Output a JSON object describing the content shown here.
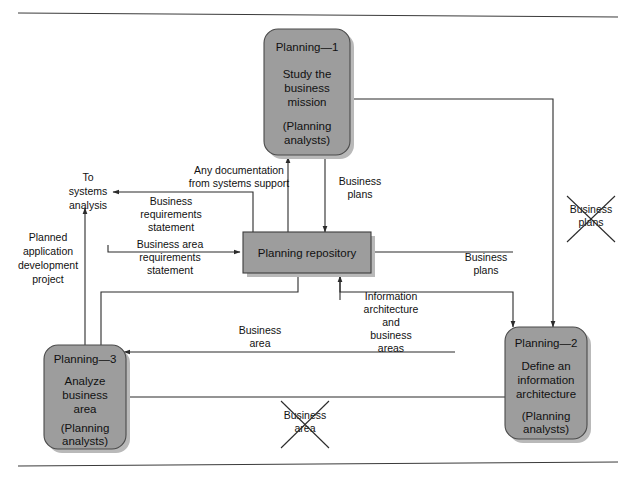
{
  "figure": {
    "background_color": "#ffffff",
    "box_fill_color": "#9d9d9d",
    "line_color": "#2b2b2b"
  },
  "processes": [
    {
      "id": "planning-1",
      "number": "Planning—1",
      "name_line1": "Study the",
      "name_line2": "business",
      "name_line3": "mission",
      "actor_line1": "(Planning",
      "actor_line2": "analysts)"
    },
    {
      "id": "planning-2",
      "number": "Planning—2",
      "name_line1": "Define an",
      "name_line2": "information",
      "name_line3": "architecture",
      "actor_line1": "(Planning",
      "actor_line2": "analysts)"
    },
    {
      "id": "planning-3",
      "number": "Planning—3",
      "name_line1": "Analyze",
      "name_line2": "business",
      "name_line3": "area",
      "actor_line1": "(Planning",
      "actor_line2": "analysts)"
    }
  ],
  "datastore": {
    "id": "planning-repository",
    "label": "Planning repository"
  },
  "external": {
    "to_systems_analysis": {
      "line1": "To",
      "line2": "systems",
      "line3": "analysis"
    },
    "planned_application": {
      "line1": "Planned",
      "line2": "application",
      "line3": "development",
      "line4": "project"
    }
  },
  "flows": [
    {
      "id": "any-documentation",
      "line1": "Any documentation",
      "line2": "from systems support"
    },
    {
      "id": "business-requirements-statement",
      "line1": "Business",
      "line2": "requirements",
      "line3": "statement"
    },
    {
      "id": "business-area-requirements-statement",
      "line1": "Business area",
      "line2": "requirements",
      "line3": "statement"
    },
    {
      "id": "business-plans-to-repository",
      "line1": "Business",
      "line2": "plans"
    },
    {
      "id": "business-plans-to-planning-2",
      "line1": "Business",
      "line2": "plans"
    },
    {
      "id": "business-area-to-repository",
      "line1": "Business",
      "line2": "area"
    },
    {
      "id": "information-architecture-and-business-areas",
      "line1": "Information",
      "line2": "architecture",
      "line3": "and",
      "line4": "business",
      "line5": "areas"
    }
  ],
  "struck_out_flows": [
    {
      "id": "business-plans-struck",
      "line1": "Business",
      "line2": "plans"
    },
    {
      "id": "business-area-struck",
      "line1": "Business",
      "line2": "area"
    }
  ]
}
